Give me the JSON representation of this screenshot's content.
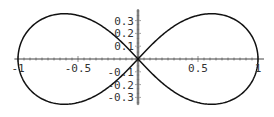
{
  "chart_data": {
    "type": "line",
    "title": "",
    "xlabel": "",
    "ylabel": "",
    "xlim": [
      -1.03,
      1.05
    ],
    "ylim": [
      -0.36,
      0.39
    ],
    "grid": false,
    "legend": null,
    "x_ticks": [
      -1,
      -0.5,
      0.5,
      1
    ],
    "x_tick_labels": [
      "-1",
      "-0.5",
      "0.5",
      "1"
    ],
    "y_ticks": [
      0.3,
      0.2,
      0.1,
      -0.1,
      -0.2,
      -0.3
    ],
    "y_tick_labels": [
      "0.3",
      "0.2",
      "0.1",
      "-0.1",
      "-0.2",
      "-0.3"
    ],
    "series": [
      {
        "name": "lemniscate",
        "color": "#111111",
        "parametric": "x = cos(t)/(1+sin(t)^2), y = sin(t)cos(t)/(1+sin(t)^2)",
        "key_points": [
          {
            "x": 1,
            "y": 0
          },
          {
            "x": 0.612,
            "y": 0.354
          },
          {
            "x": 0,
            "y": 0
          },
          {
            "x": -0.612,
            "y": -0.354
          },
          {
            "x": -1,
            "y": 0
          },
          {
            "x": -0.612,
            "y": 0.354
          },
          {
            "x": 0.612,
            "y": -0.354
          }
        ]
      }
    ]
  },
  "colors": {
    "curve": "#111111",
    "axis": "#444444",
    "label": "#333333",
    "background": "#ffffff"
  }
}
